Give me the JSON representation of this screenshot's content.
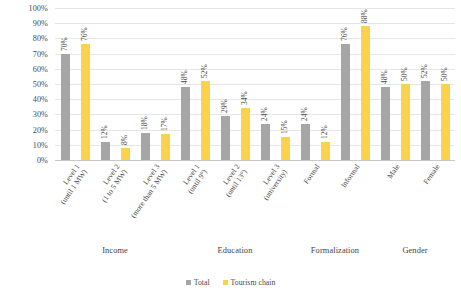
{
  "chart_data": {
    "type": "bar",
    "title": "",
    "xlabel": "",
    "ylabel": "",
    "ylim": [
      0,
      100
    ],
    "y_tick_labels": [
      "100%",
      "90%",
      "80%",
      "70%",
      "60%",
      "50%",
      "40%",
      "30%",
      "20%",
      "10%",
      "0%"
    ],
    "y_ticks": [
      100,
      90,
      80,
      70,
      60,
      50,
      40,
      30,
      20,
      10,
      0
    ],
    "grid": true,
    "legend_position": "bottom-center",
    "series": [
      {
        "name": "Total",
        "color": "#a6a6a6",
        "values": [
          70,
          12,
          18,
          48,
          29,
          24,
          24,
          76,
          48,
          52
        ]
      },
      {
        "name": "Tourism chain",
        "color": "#fbd24e",
        "values": [
          76,
          8,
          17,
          52,
          34,
          15,
          12,
          88,
          50,
          50
        ]
      }
    ],
    "categories": [
      "Level 1 (until 1 MW)",
      "Level 2 (1 to 5 MW)",
      "Level 3 (more than 5 MW)",
      "Level 1 (until 9°)",
      "Level 2 (until 13°)",
      "Level 3 (university)",
      "Formal",
      "Informal",
      "Male",
      "Female"
    ],
    "value_labels": [
      [
        "70%",
        "76%"
      ],
      [
        "12%",
        "8%"
      ],
      [
        "18%",
        "17%"
      ],
      [
        "48%",
        "52%"
      ],
      [
        "29%",
        "34%"
      ],
      [
        "24%",
        "15%"
      ],
      [
        "24%",
        "12%"
      ],
      [
        "76%",
        "88%"
      ],
      [
        "48%",
        "50%"
      ],
      [
        "52%",
        "50%"
      ]
    ],
    "groups": [
      {
        "label": "Income",
        "categories": [
          {
            "line1": "Level 1",
            "line2": "(until 1 MW)",
            "total": 70,
            "chain": 76,
            "total_label": "70%",
            "chain_label": "76%"
          },
          {
            "line1": "Level 2",
            "line2": "(1 to 5 MW)",
            "total": 12,
            "chain": 8,
            "total_label": "12%",
            "chain_label": "8%"
          },
          {
            "line1": "Level 3",
            "line2": "(more than 5 MW)",
            "total": 18,
            "chain": 17,
            "total_label": "18%",
            "chain_label": "17%"
          }
        ]
      },
      {
        "label": "Education",
        "categories": [
          {
            "line1": "Level 1",
            "line2": "(until 9°)",
            "total": 48,
            "chain": 52,
            "total_label": "48%",
            "chain_label": "52%"
          },
          {
            "line1": "Level 2",
            "line2": "(until 13°)",
            "total": 29,
            "chain": 34,
            "total_label": "29%",
            "chain_label": "34%"
          },
          {
            "line1": "Level 3",
            "line2": "(university)",
            "total": 24,
            "chain": 15,
            "total_label": "24%",
            "chain_label": "15%"
          }
        ]
      },
      {
        "label": "Formalization",
        "categories": [
          {
            "line1": "Formal",
            "line2": "",
            "total": 24,
            "chain": 12,
            "total_label": "24%",
            "chain_label": "12%"
          },
          {
            "line1": "Informal",
            "line2": "",
            "total": 76,
            "chain": 88,
            "total_label": "76%",
            "chain_label": "88%"
          }
        ]
      },
      {
        "label": "Gender",
        "categories": [
          {
            "line1": "Male",
            "line2": "",
            "total": 48,
            "chain": 50,
            "total_label": "48%",
            "chain_label": "50%"
          },
          {
            "line1": "Female",
            "line2": "",
            "total": 52,
            "chain": 50,
            "total_label": "52%",
            "chain_label": "50%"
          }
        ]
      }
    ],
    "legend": [
      {
        "label": "Total",
        "color": "#a6a6a6"
      },
      {
        "label": "Tourism chain",
        "color": "#fbd24e"
      }
    ]
  }
}
